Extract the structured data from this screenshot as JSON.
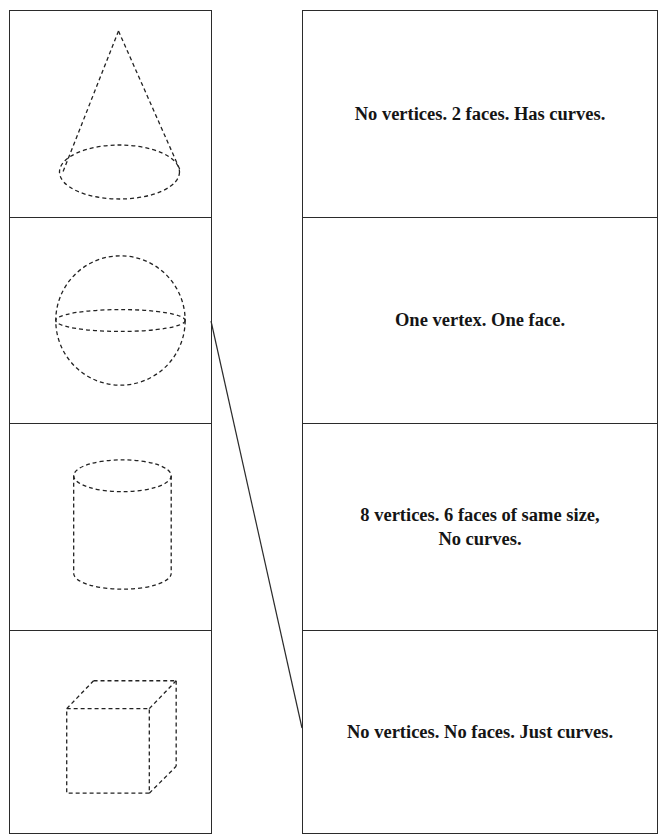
{
  "worksheet": {
    "shapes": [
      {
        "name": "cone",
        "icon": "cone-icon"
      },
      {
        "name": "sphere",
        "icon": "sphere-icon"
      },
      {
        "name": "cylinder",
        "icon": "cylinder-icon"
      },
      {
        "name": "cube",
        "icon": "cube-icon"
      }
    ],
    "descriptions": [
      {
        "line1": "No vertices. 2  faces.  Has curves.",
        "line2": ""
      },
      {
        "line1": "One vertex. One  face.",
        "line2": ""
      },
      {
        "line1": "8 vertices. 6  faces of  same size,",
        "line2": "No curves."
      },
      {
        "line1": "No vertices. No  faces. Just curves.",
        "line2": ""
      }
    ],
    "connections": [
      {
        "from_shape": "sphere",
        "to_description": 3
      }
    ],
    "colors": {
      "line": "#2b2b2b",
      "text": "#151515",
      "background": "#ffffff"
    }
  }
}
